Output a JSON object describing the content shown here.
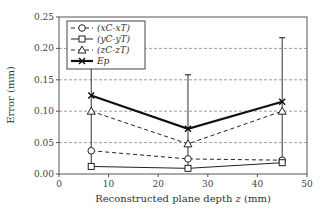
{
  "chart_data": {
    "type": "line",
    "title": "",
    "xlabel": "Reconstructed plane depth z (mm)",
    "ylabel": "Error (mm)",
    "xlim": [
      0,
      50
    ],
    "ylim": [
      0,
      0.25
    ],
    "x_ticks": [
      "0",
      "10",
      "20",
      "30",
      "40",
      "50"
    ],
    "y_ticks": [
      "0.00",
      "0.05",
      "0.10",
      "0.15",
      "0.20",
      "0.25"
    ],
    "grid": "horizontal dashed",
    "legend_position": "upper left",
    "x": [
      6.5,
      26,
      45
    ],
    "series": [
      {
        "name": "(xC-xT)",
        "marker": "circle",
        "line": "dashed",
        "values": [
          0.037,
          0.024,
          0.022
        ]
      },
      {
        "name": "(yC-yT)",
        "marker": "square",
        "line": "solid-thin",
        "values": [
          0.012,
          0.009,
          0.018
        ]
      },
      {
        "name": "(zC-zT)",
        "marker": "triangle",
        "line": "dashed",
        "values": [
          0.1,
          0.048,
          0.1
        ]
      },
      {
        "name": "Ep",
        "marker": "x",
        "line": "solid-bold",
        "values": [
          0.125,
          0.072,
          0.115
        ],
        "error_upper": [
          0.169,
          0.158,
          0.217
        ],
        "error_lower": [
          0.012,
          0.009,
          0.018
        ]
      }
    ]
  },
  "axes": {
    "xlabel": "Reconstructed plane depth z (mm)",
    "xlabel_prefix": "Reconstructed plane depth ",
    "xlabel_var": "z",
    "xlabel_suffix": " (mm)",
    "ylabel": "Error (mm)"
  },
  "legend": [
    {
      "label": "(xC-xT)"
    },
    {
      "label": "(yC-yT)"
    },
    {
      "label": "(zC-zT)"
    },
    {
      "label": "Ep"
    }
  ]
}
